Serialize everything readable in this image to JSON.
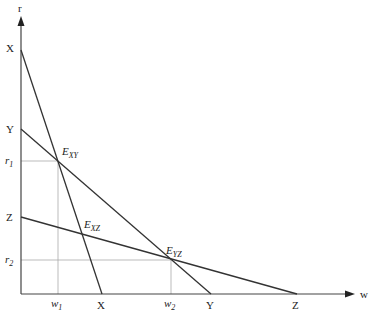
{
  "axes": {
    "x_label": "w",
    "y_label": "r",
    "origin": [
      21,
      294
    ],
    "x_end": 354,
    "y_end": 18
  },
  "lines": [
    {
      "name": "X",
      "y_intercept_label": "X",
      "x_intercept_label": "X",
      "from": [
        21,
        50
      ],
      "to": [
        102,
        294
      ]
    },
    {
      "name": "Y",
      "y_intercept_label": "Y",
      "x_intercept_label": "Y",
      "from": [
        21,
        129
      ],
      "to": [
        211,
        294
      ]
    },
    {
      "name": "Z",
      "y_intercept_label": "Z",
      "x_intercept_label": "Z",
      "from": [
        21,
        217
      ],
      "to": [
        297,
        294
      ]
    }
  ],
  "points": {
    "exy": {
      "main": "E",
      "sub": "XY",
      "x": 58,
      "y": 161
    },
    "exz": {
      "main": "E",
      "sub": "XZ",
      "x": 82,
      "y": 233
    },
    "eyz": {
      "main": "E",
      "sub": "YZ",
      "x": 171,
      "y": 260
    }
  },
  "ticks": {
    "r1": {
      "main": "r",
      "sub": "1"
    },
    "r2": {
      "main": "r",
      "sub": "2"
    },
    "w1": {
      "main": "w",
      "sub": "1"
    },
    "w2": {
      "main": "w",
      "sub": "2"
    }
  },
  "colors": {
    "line": "#333333",
    "guide": "#999999",
    "text": "#222222"
  }
}
